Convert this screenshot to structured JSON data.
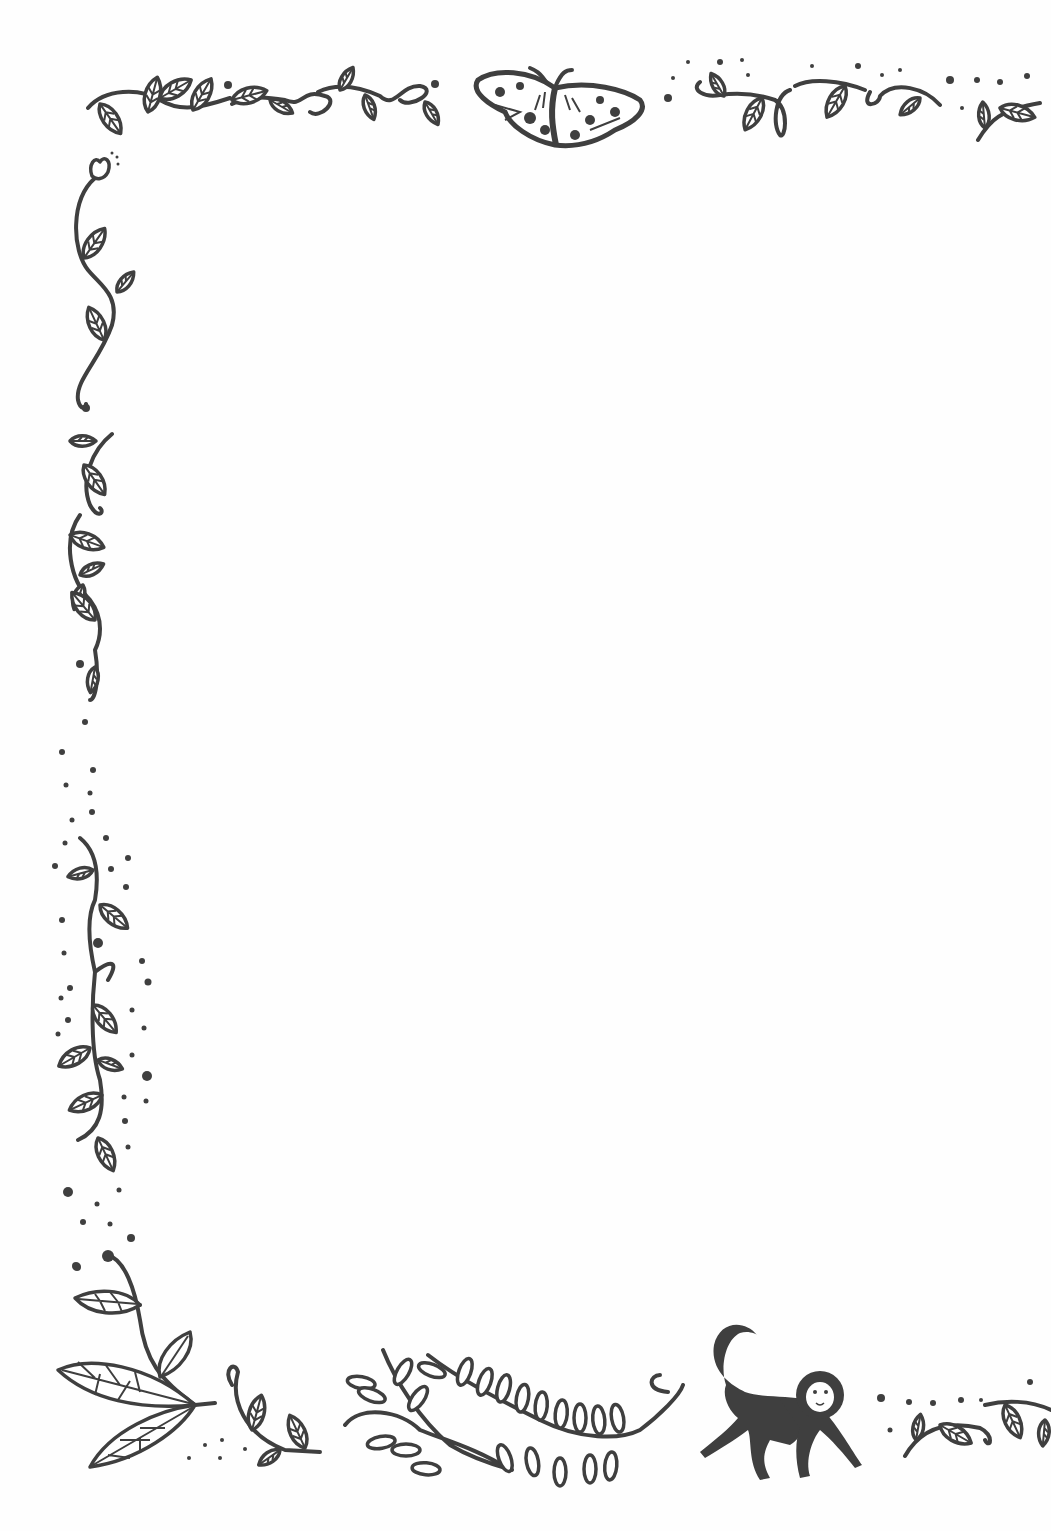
{
  "page": {
    "type": "decorative border illustration",
    "background": "#fefefe",
    "ink_color": "#3f3f3f"
  },
  "elements": {
    "top_left_vine": "leafy vine with curls",
    "top_moth": "patterned moth",
    "top_right_vine": "vine with leaves and dots",
    "left_flower_vine": "vine with small flower",
    "left_mid_vine": "leafy vine",
    "left_lower_vine": "leafy vine surrounded by dots",
    "bottom_left_branch": "large leaf branch",
    "bottom_fern": "fern fronds",
    "bottom_monkey": "walking monkey",
    "bottom_right_vine": "vine with leaves and dots"
  }
}
